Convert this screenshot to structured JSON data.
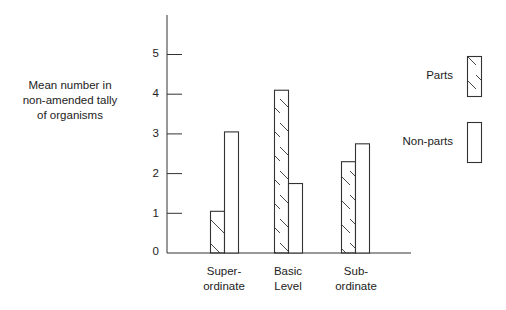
{
  "chart_data": {
    "type": "bar",
    "title": "",
    "xlabel": "",
    "ylabel": "Mean number in\nnon-amended tally\nof organisms",
    "categories": [
      "Super-\nordinate",
      "Basic\nLevel",
      "Sub-\nordinate"
    ],
    "series": [
      {
        "name": "Parts",
        "pattern": "hatched",
        "values": [
          1.05,
          4.1,
          2.3
        ]
      },
      {
        "name": "Non-parts",
        "pattern": "empty",
        "values": [
          3.05,
          1.75,
          2.75
        ]
      }
    ],
    "yticks": [
      "0",
      "1",
      "2",
      "3",
      "4",
      "5"
    ],
    "ylim": [
      0,
      6
    ],
    "grid": false,
    "legend_position": "right"
  },
  "colors": {
    "stroke": "#333333",
    "background": "#ffffff"
  }
}
